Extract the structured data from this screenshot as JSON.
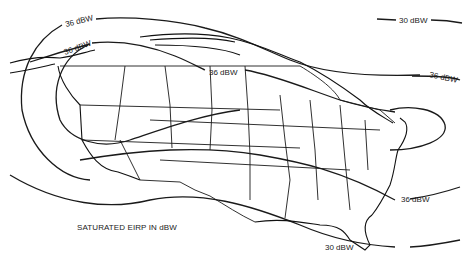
{
  "figure": {
    "caption": "SATURATED EIRP IN dBW",
    "region": "Continental United States, Canada, Alaska",
    "contours": [
      {
        "id": "outer-30",
        "label": "30 dBW",
        "level_dbw": 30
      },
      {
        "id": "inner-36-north",
        "label": "36 dBW",
        "level_dbw": 36
      },
      {
        "id": "inner-36-west",
        "label": "36 dBW",
        "level_dbw": 36
      },
      {
        "id": "inner-36-center",
        "label": "36 dBW",
        "level_dbw": 36
      },
      {
        "id": "inner-36-east",
        "label": "36 dBW",
        "level_dbw": 36
      },
      {
        "id": "inner-36-southeast",
        "label": "36 dBW",
        "level_dbw": 36
      },
      {
        "id": "outer-30-south",
        "label": "30 dBW",
        "level_dbw": 30
      }
    ]
  }
}
